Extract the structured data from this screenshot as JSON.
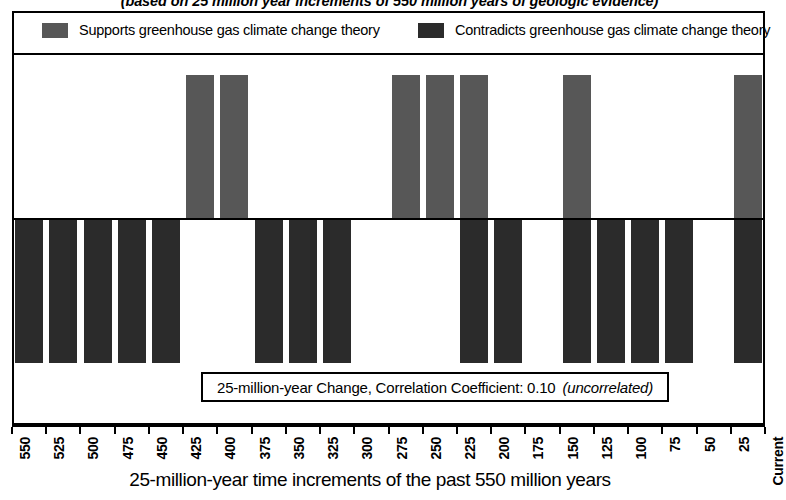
{
  "chart_data": {
    "type": "bar",
    "title": "",
    "subtitle": "(based on 25 million year increments of 550 million years of geologic evidence)",
    "xlabel": "25-million-year time increments of the past 550 million years",
    "ylabel": "",
    "grid": false,
    "legend_position": "top",
    "orientation": "vertical-diverging",
    "categories": [
      550,
      525,
      500,
      475,
      450,
      425,
      400,
      375,
      350,
      325,
      300,
      275,
      250,
      225,
      200,
      175,
      150,
      125,
      100,
      75,
      50,
      25
    ],
    "tick_labels": [
      "550",
      "525",
      "500",
      "475",
      "450",
      "425",
      "400",
      "375",
      "350",
      "325",
      "300",
      "275",
      "250",
      "225",
      "200",
      "175",
      "150",
      "125",
      "100",
      "75",
      "50",
      "25"
    ],
    "axis_end_label": "Current",
    "series": [
      {
        "name": "Supports greenhouse gas climate change theory",
        "color": "#575757",
        "direction": "up",
        "values": [
          0,
          0,
          0,
          0,
          0,
          1,
          1,
          0,
          0,
          0,
          0,
          1,
          1,
          1,
          0,
          0,
          1,
          0,
          0,
          0,
          0,
          1
        ]
      },
      {
        "name": "Contradicts greenhouse gas climate change theory",
        "color": "#2b2b2b",
        "direction": "down",
        "values": [
          1,
          1,
          1,
          1,
          1,
          0,
          0,
          1,
          1,
          1,
          0,
          0,
          0,
          1,
          1,
          0,
          1,
          1,
          1,
          1,
          0,
          1
        ]
      }
    ],
    "annotation": {
      "text": "25-million-year Change, Correlation Coefficient:  0.10",
      "note": "(uncorrelated)",
      "correlation_coefficient": 0.1
    }
  },
  "legend": {
    "supports": {
      "label": "Supports greenhouse gas climate change theory",
      "color": "#575757"
    },
    "contradicts": {
      "label": "Contradicts greenhouse gas climate change theory",
      "color": "#2b2b2b"
    }
  },
  "axis": {
    "title": "25-million-year time increments of the past 550 million years",
    "current_label": "Current"
  },
  "colors": {
    "supports_bar": "#575757",
    "contradicts_bar": "#2b2b2b",
    "frame": "#000000",
    "background": "#ffffff"
  }
}
